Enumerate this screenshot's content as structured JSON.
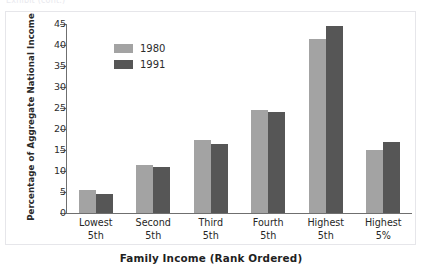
{
  "top_caption": "Exhibit (cont.)",
  "chart_data": {
    "type": "bar",
    "title": "",
    "subtitle": "",
    "xlabel": "Family Income (Rank Ordered)",
    "ylabel": "Percentage of Aggregate National Income",
    "categories": [
      {
        "line1": "Lowest",
        "line2": "5th"
      },
      {
        "line1": "Second",
        "line2": "5th"
      },
      {
        "line1": "Third",
        "line2": "5th"
      },
      {
        "line1": "Fourth",
        "line2": "5th"
      },
      {
        "line1": "Highest",
        "line2": "5th"
      },
      {
        "line1": "Highest",
        "line2": "5%"
      }
    ],
    "series": [
      {
        "name": "1980",
        "color": "#a3a3a3",
        "values": [
          5.5,
          11.5,
          17.5,
          24.5,
          41.5,
          15.0
        ]
      },
      {
        "name": "1991",
        "color": "#565656",
        "values": [
          4.5,
          11.0,
          16.5,
          24.0,
          44.5,
          17.0
        ]
      }
    ],
    "ylim": [
      0,
      45
    ],
    "ytick_values": [
      0,
      5,
      10,
      15,
      20,
      25,
      30,
      35,
      40,
      45
    ],
    "ytick_labels": [
      "0",
      "5",
      "10",
      "15",
      "20",
      "25",
      "30",
      "35",
      "40",
      "45"
    ],
    "grid": false,
    "legend_position": "upper-left-inside"
  }
}
